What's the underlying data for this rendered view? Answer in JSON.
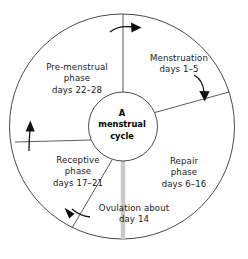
{
  "diagram": {
    "title": "A menstrual cycle",
    "center": {
      "name": "center-hub",
      "lines": [
        "A",
        "menstrual",
        "cycle"
      ]
    },
    "colors": {
      "stroke": "#4a4a4a",
      "text": "#1a1a1a",
      "background": "#ffffff",
      "ovulation_bar": "#c9c9c9"
    },
    "phases": [
      {
        "key": "menstruation",
        "lines": [
          "Menstruation",
          "days 1–5"
        ],
        "days": "1–5"
      },
      {
        "key": "repair",
        "lines": [
          "Repair",
          "phase",
          "days 6–16"
        ],
        "days": "6–16"
      },
      {
        "key": "ovulation",
        "lines": [
          "Ovulation about",
          "day 14"
        ],
        "days": "14"
      },
      {
        "key": "receptive",
        "lines": [
          "Receptive",
          "phase",
          "days 17–21"
        ],
        "days": "17–21"
      },
      {
        "key": "premenstrual",
        "lines": [
          "Pre-menstrual",
          "phase",
          "days 22–28"
        ],
        "days": "22–28"
      }
    ],
    "labels": {
      "menstruation": {
        "l1": "Menstruation",
        "l2": "days 1–5"
      },
      "premenstrual": {
        "l1": "Pre-menstrual",
        "l2": "phase",
        "l3": "days 22–28"
      },
      "receptive": {
        "l1": "Receptive",
        "l2": "phase",
        "l3": "days 17–21"
      },
      "repair": {
        "l1": "Repair",
        "l2": "phase",
        "l3": "days 6–16"
      },
      "ovulation": {
        "l1": "Ovulation about",
        "l2": "day 14"
      },
      "center": {
        "l1": "A",
        "l2": "menstrual",
        "l3": "cycle"
      }
    },
    "arrows": [
      {
        "name": "arrow-top-clockwise",
        "direction": "right"
      },
      {
        "name": "arrow-upper-right-clockwise",
        "direction": "down-right"
      },
      {
        "name": "arrow-lower-left-clockwise",
        "direction": "up-left"
      },
      {
        "name": "arrow-left-clockwise",
        "direction": "up"
      }
    ]
  }
}
